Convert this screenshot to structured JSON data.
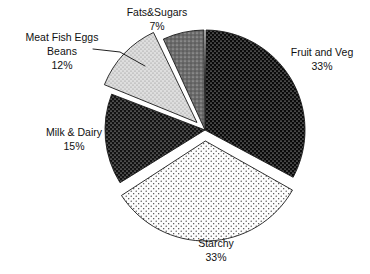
{
  "chart_data": {
    "type": "pie",
    "title": "",
    "subtitle": "",
    "xlabel": "",
    "ylabel": "",
    "legend_position": "none",
    "grid": false,
    "value_unit": "%",
    "categories": [
      "Fruit and Veg",
      "Starchy",
      "Milk & Dairy",
      "Meat Fish Eggs Beans",
      "Fats&Sugars"
    ],
    "values": [
      33,
      33,
      15,
      12,
      7
    ],
    "slices": [
      {
        "label": "Fruit and Veg",
        "label_line1": "Fruit and Veg",
        "label_line2": "33%",
        "value": 33,
        "percent_text": "33%",
        "fill": "#0a0a0a",
        "pattern": "white-dots-on-black",
        "exploded": false,
        "start_angle": 0,
        "end_angle": 118.8,
        "label_x": 322,
        "label_y": 56
      },
      {
        "label": "Starchy",
        "label_line1": "Starchy",
        "label_line2": "33%",
        "value": 33,
        "percent_text": "33%",
        "fill": "#fdfdfd",
        "pattern": "black-dots-on-white",
        "exploded": true,
        "start_angle": 118.8,
        "end_angle": 237.6,
        "label_x": 216,
        "label_y": 247
      },
      {
        "label": "Milk & Dairy",
        "label_line1": "Milk & Dairy",
        "label_line2": "15%",
        "value": 15,
        "percent_text": "15%",
        "fill": "#121212",
        "pattern": "white-dots-on-black",
        "exploded": false,
        "start_angle": 237.6,
        "end_angle": 291.6,
        "label_x": 74,
        "label_y": 136
      },
      {
        "label": "Meat Fish Eggs Beans",
        "label_line1": "Meat Fish Eggs",
        "label_line2": "Beans",
        "label_line3": "12%",
        "value": 12,
        "percent_text": "12%",
        "fill": "#d9d9d9",
        "pattern": "gray-dots",
        "exploded": true,
        "start_angle": 291.6,
        "end_angle": 334.8,
        "label_x": 62,
        "label_y": 41
      },
      {
        "label": "Fats&Sugars",
        "label_line1": "Fats&Sugars",
        "label_line2": "7%",
        "value": 7,
        "percent_text": "7%",
        "fill": "#6b6b6b",
        "pattern": "dark-gray-dots",
        "exploded": false,
        "start_angle": 334.8,
        "end_angle": 360,
        "label_x": 157,
        "label_y": 16
      }
    ],
    "geometry": {
      "center_x": 205,
      "center_y": 130,
      "radius": 100
    },
    "colors": {
      "background": "#ffffff",
      "outline": "#1a1a1a",
      "text": "#111111"
    }
  }
}
